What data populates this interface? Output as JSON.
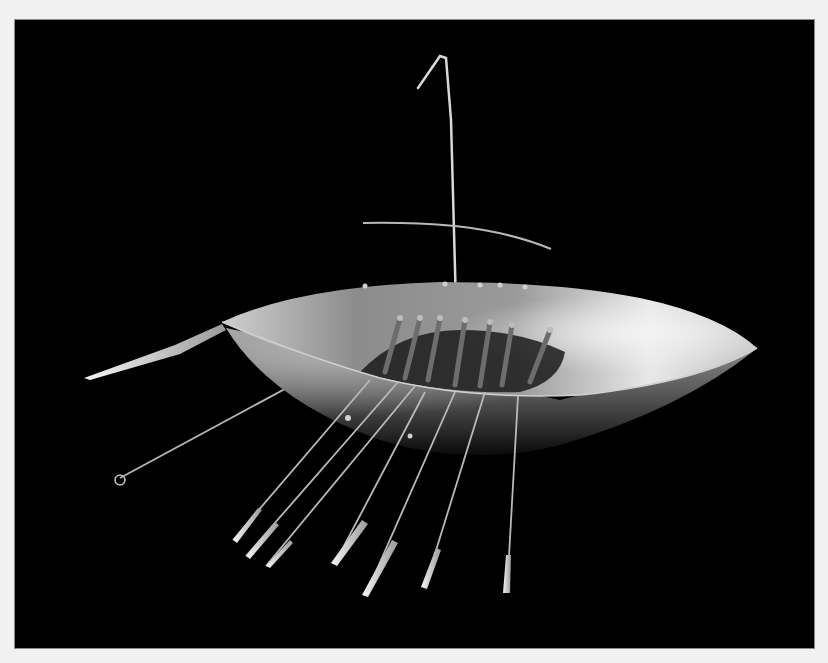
{
  "image": {
    "subject": "Gold model boat with mast, yard, rowing benches and oars",
    "style": "monochrome studio photograph on black background",
    "colors": {
      "page_background": "#f1f1f1",
      "photo_background": "#000000",
      "metal_highlight": "#e6e6e6",
      "metal_mid": "#9a9a9a",
      "metal_shadow": "#3a3a3a"
    },
    "elements": {
      "hull": "boat-hull",
      "mast": "mast-with-hook",
      "yard": "cross-yard",
      "benches": 7,
      "oars_port_visible": 9,
      "steering_oar": "steering-oar"
    }
  }
}
